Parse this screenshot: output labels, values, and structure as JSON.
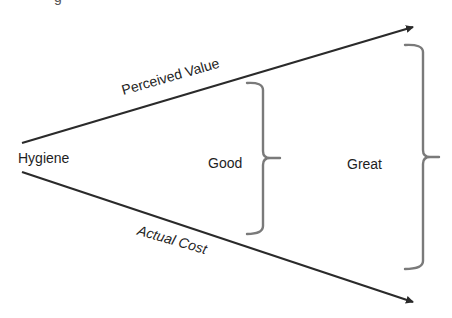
{
  "diagram": {
    "type": "value-cost-funnel",
    "top_fragment": "g",
    "origin_label": "Hygiene",
    "upper_line": {
      "label": "Perceived Value",
      "start": [
        22,
        143
      ],
      "end": [
        414,
        27
      ]
    },
    "lower_line": {
      "label": "Actual Cost",
      "start": [
        22,
        172
      ],
      "end": [
        414,
        302
      ]
    },
    "brackets": [
      {
        "label": "Good",
        "top_y": 83,
        "bottom_y": 234,
        "spine_x": 263,
        "tip_x": 280,
        "mid_y": 158
      },
      {
        "label": "Great",
        "top_y": 45,
        "bottom_y": 269,
        "spine_x": 423,
        "tip_x": 439,
        "mid_y": 157
      }
    ],
    "colors": {
      "line": "#2a2a2a",
      "bracket": "#7a7a7a",
      "text": "#1e1e1e",
      "background": "#ffffff"
    }
  }
}
